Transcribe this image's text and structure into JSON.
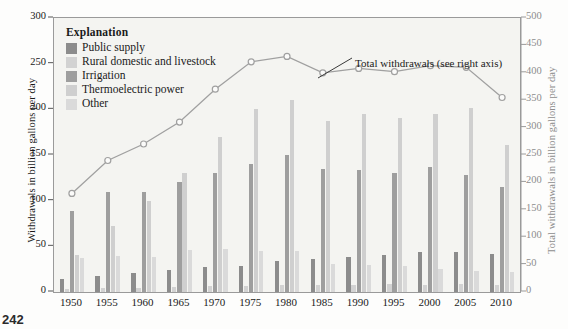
{
  "page": {
    "number": "242"
  },
  "chart_data": {
    "type": "bar",
    "title": "",
    "categories": [
      "1950",
      "1955",
      "1960",
      "1965",
      "1970",
      "1975",
      "1980",
      "1985",
      "1990",
      "1995",
      "2000",
      "2005",
      "2010"
    ],
    "xlabel": "",
    "ylabel": "Withdrawals in billion gallons per day",
    "ylim": [
      0,
      300
    ],
    "yticks": [
      0,
      50,
      100,
      150,
      200,
      250,
      300
    ],
    "y2label": "Total withdrawals in billion gallons per day",
    "y2lim": [
      0,
      500
    ],
    "y2ticks": [
      0,
      50,
      100,
      150,
      200,
      250,
      300,
      350,
      400,
      450,
      500
    ],
    "grid": false,
    "legend_position": "upper-left",
    "legend_title": "Explanation",
    "series": [
      {
        "name": "Public supply",
        "color": "#8c8c8c",
        "values": [
          14,
          17,
          21,
          24,
          27,
          29,
          34,
          36.5,
          38.5,
          40.5,
          43.5,
          44,
          42
        ]
      },
      {
        "name": "Rural domestic and livestock",
        "color": "#d2d2d2",
        "values": [
          3.6,
          4.2,
          4.5,
          5.4,
          6.2,
          6.8,
          7.8,
          7.9,
          7.9,
          8.9,
          8.2,
          8.5,
          8.0
        ]
      },
      {
        "name": "Irrigation",
        "color": "#9e9e9e",
        "values": [
          89,
          110,
          110,
          120,
          130,
          140,
          150,
          135,
          134,
          130,
          137,
          128,
          115
        ]
      },
      {
        "name": "Thermoelectric power",
        "color": "#cfcfcf",
        "values": [
          40,
          72,
          100,
          130,
          170,
          200,
          210,
          187,
          195,
          190,
          195,
          201,
          161
        ]
      },
      {
        "name": "Other",
        "color": "#dadada",
        "values": [
          37,
          39,
          38,
          46,
          47,
          45,
          45,
          30.5,
          30,
          29,
          25,
          23.5,
          22
        ]
      }
    ],
    "line_series": {
      "name": "Total withdrawals (see right axis)",
      "axis": "right",
      "color": "#a0a0a0",
      "marker": "open-circle",
      "annotation": "Total withdrawals (see right axis)",
      "values": [
        180,
        240,
        270,
        310,
        370,
        420,
        430,
        400,
        408,
        402,
        413,
        410,
        355
      ]
    }
  }
}
